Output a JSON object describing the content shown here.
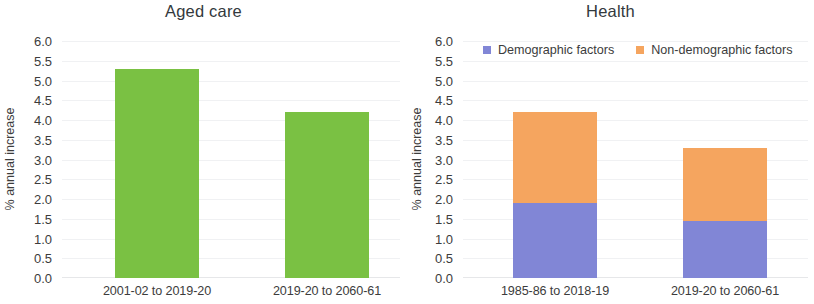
{
  "chart_data": [
    {
      "type": "bar",
      "title": "Aged care",
      "xlabel": "",
      "ylabel": "% annual increase",
      "categories": [
        "2001-02 to 2019-20",
        "2019-20 to 2060-61"
      ],
      "values": [
        5.3,
        4.2
      ],
      "ylim": [
        0.0,
        6.0
      ],
      "ytick_step": 0.5,
      "yticks": [
        "6.0",
        "5.5",
        "5.0",
        "4.5",
        "4.0",
        "3.5",
        "3.0",
        "2.5",
        "2.0",
        "1.5",
        "1.0",
        "0.5",
        "0.0"
      ],
      "grid": true,
      "legend": false,
      "color": "#7ac143"
    },
    {
      "type": "bar",
      "stacked": true,
      "title": "Health",
      "xlabel": "",
      "ylabel": "% annual increase",
      "categories": [
        "1985-86 to 2018-19",
        "2019-20 to 2060-61"
      ],
      "series": [
        {
          "name": "Demographic factors",
          "values": [
            1.9,
            1.45
          ],
          "color": "#8186d6"
        },
        {
          "name": "Non-demographic factors",
          "values": [
            2.3,
            1.85
          ],
          "color": "#f5a55f"
        }
      ],
      "totals": [
        4.2,
        3.3
      ],
      "ylim": [
        0.0,
        6.0
      ],
      "ytick_step": 0.5,
      "yticks": [
        "6.0",
        "5.5",
        "5.0",
        "4.5",
        "4.0",
        "3.5",
        "3.0",
        "2.5",
        "2.0",
        "1.5",
        "1.0",
        "0.5",
        "0.0"
      ],
      "grid": true,
      "legend": true,
      "legend_position": "top"
    }
  ]
}
